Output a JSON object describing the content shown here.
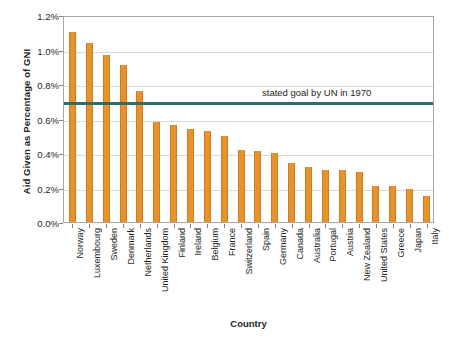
{
  "chart_data": {
    "type": "bar",
    "title": "",
    "xlabel": "Country",
    "ylabel": "Aid Given as Percentage of GNI",
    "ylim": [
      0,
      1.2
    ],
    "ytick_labels": [
      "0.0%",
      "0.2%",
      "0.4%",
      "0.6%",
      "0.8%",
      "1.0%",
      "1.2%"
    ],
    "ytick_values": [
      0.0,
      0.2,
      0.4,
      0.6,
      0.8,
      1.0,
      1.2
    ],
    "grid": "horizontal",
    "legend": "none",
    "bar_color": "#e8922e",
    "categories": [
      "Norway",
      "Luxembourg",
      "Sweden",
      "Denmark",
      "Netherlands",
      "United Kingdom",
      "Finland",
      "Ireland",
      "Belgium",
      "France",
      "Switzerland",
      "Spain",
      "Germany",
      "Canada",
      "Australia",
      "Portugal",
      "Austria",
      "New Zealand",
      "United States",
      "Greece",
      "Japan",
      "Italy"
    ],
    "values": [
      1.1,
      1.04,
      0.97,
      0.91,
      0.76,
      0.58,
      0.56,
      0.54,
      0.53,
      0.5,
      0.42,
      0.41,
      0.4,
      0.34,
      0.32,
      0.3,
      0.3,
      0.29,
      0.21,
      0.21,
      0.19,
      0.15
    ],
    "annotations": [
      {
        "label": "stated goal by UN in 1970",
        "type": "hline",
        "value": 0.7,
        "color": "#2e6b6b"
      }
    ]
  }
}
